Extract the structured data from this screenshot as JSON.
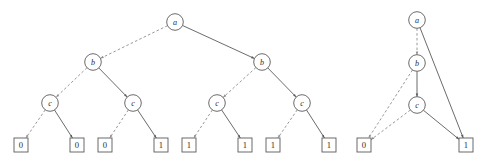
{
  "figure": {
    "width": 489,
    "height": 161,
    "colors": {
      "background": "#ffffff",
      "solid_edge": "#5a5a5a",
      "dashed_edge": "#8d8d8d",
      "node_stroke": "#5a5a5a",
      "node_fill": "#ffffff",
      "label_text": "#2b2b2b"
    },
    "edge_legend": {
      "dashed": "low edge (variable = 0)",
      "solid": "high edge (variable = 1)"
    }
  },
  "diagrams": [
    {
      "id": "decision-tree",
      "name": "full-binary-decision-tree",
      "variables": [
        "a",
        "b",
        "c"
      ],
      "nodes": [
        {
          "id": "t-a",
          "label": "a",
          "shape": "circle",
          "cx": 175,
          "cy": 22,
          "r": 8.3,
          "level": 0
        },
        {
          "id": "t-b1",
          "label": "b",
          "shape": "circle",
          "cx": 93,
          "cy": 62,
          "r": 8.3,
          "level": 1
        },
        {
          "id": "t-b2",
          "label": "b",
          "shape": "circle",
          "cx": 262,
          "cy": 62,
          "r": 8.3,
          "level": 1
        },
        {
          "id": "t-c1",
          "label": "c",
          "shape": "circle",
          "cx": 50,
          "cy": 103,
          "r": 8.3,
          "level": 2
        },
        {
          "id": "t-c2",
          "label": "c",
          "shape": "circle",
          "cx": 133,
          "cy": 103,
          "r": 8.3,
          "level": 2
        },
        {
          "id": "t-c3",
          "label": "c",
          "shape": "circle",
          "cx": 217,
          "cy": 103,
          "r": 8.3,
          "level": 2
        },
        {
          "id": "t-c4",
          "label": "c",
          "shape": "circle",
          "cx": 302,
          "cy": 103,
          "r": 8.3,
          "level": 2
        },
        {
          "id": "t-l1",
          "label": "0",
          "shape": "box",
          "cx": 21,
          "cy": 145,
          "w": 14,
          "h": 14,
          "level": 3
        },
        {
          "id": "t-l2",
          "label": "0",
          "shape": "box",
          "cx": 77,
          "cy": 145,
          "w": 14,
          "h": 14,
          "level": 3
        },
        {
          "id": "t-l3",
          "label": "0",
          "shape": "box",
          "cx": 105,
          "cy": 145,
          "w": 14,
          "h": 14,
          "level": 3
        },
        {
          "id": "t-l4",
          "label": "1",
          "shape": "box",
          "cx": 161,
          "cy": 145,
          "w": 14,
          "h": 14,
          "level": 3
        },
        {
          "id": "t-l5",
          "label": "1",
          "shape": "box",
          "cx": 189,
          "cy": 145,
          "w": 14,
          "h": 14,
          "level": 3
        },
        {
          "id": "t-l6",
          "label": "1",
          "shape": "box",
          "cx": 245,
          "cy": 145,
          "w": 14,
          "h": 14,
          "level": 3
        },
        {
          "id": "t-l7",
          "label": "1",
          "shape": "box",
          "cx": 273,
          "cy": 145,
          "w": 14,
          "h": 14,
          "level": 3
        },
        {
          "id": "t-l8",
          "label": "1",
          "shape": "box",
          "cx": 329,
          "cy": 145,
          "w": 14,
          "h": 14,
          "level": 3
        }
      ],
      "edges": [
        {
          "from": "t-a",
          "to": "t-b1",
          "style": "dashed",
          "value": "0"
        },
        {
          "from": "t-a",
          "to": "t-b2",
          "style": "solid",
          "value": "1"
        },
        {
          "from": "t-b1",
          "to": "t-c1",
          "style": "dashed",
          "value": "0"
        },
        {
          "from": "t-b1",
          "to": "t-c2",
          "style": "solid",
          "value": "1"
        },
        {
          "from": "t-b2",
          "to": "t-c3",
          "style": "dashed",
          "value": "0"
        },
        {
          "from": "t-b2",
          "to": "t-c4",
          "style": "solid",
          "value": "1"
        },
        {
          "from": "t-c1",
          "to": "t-l1",
          "style": "dashed",
          "value": "0"
        },
        {
          "from": "t-c1",
          "to": "t-l2",
          "style": "solid",
          "value": "1"
        },
        {
          "from": "t-c2",
          "to": "t-l3",
          "style": "dashed",
          "value": "0"
        },
        {
          "from": "t-c2",
          "to": "t-l4",
          "style": "solid",
          "value": "1"
        },
        {
          "from": "t-c3",
          "to": "t-l5",
          "style": "dashed",
          "value": "0"
        },
        {
          "from": "t-c3",
          "to": "t-l6",
          "style": "solid",
          "value": "1"
        },
        {
          "from": "t-c4",
          "to": "t-l7",
          "style": "dashed",
          "value": "0"
        },
        {
          "from": "t-c4",
          "to": "t-l8",
          "style": "solid",
          "value": "1"
        }
      ]
    },
    {
      "id": "reduced-bdd",
      "name": "reduced-binary-decision-diagram",
      "variables": [
        "a",
        "b",
        "c"
      ],
      "nodes": [
        {
          "id": "r-a",
          "label": "a",
          "shape": "circle",
          "cx": 417,
          "cy": 20,
          "r": 8.3,
          "level": 0
        },
        {
          "id": "r-b",
          "label": "b",
          "shape": "circle",
          "cx": 417,
          "cy": 63,
          "r": 8.3,
          "level": 1
        },
        {
          "id": "r-c",
          "label": "c",
          "shape": "circle",
          "cx": 417,
          "cy": 105,
          "r": 8.3,
          "level": 2
        },
        {
          "id": "r-l0",
          "label": "0",
          "shape": "box",
          "cx": 364,
          "cy": 145,
          "w": 14,
          "h": 14,
          "level": 3
        },
        {
          "id": "r-l1",
          "label": "1",
          "shape": "box",
          "cx": 466,
          "cy": 145,
          "w": 14,
          "h": 14,
          "level": 3
        }
      ],
      "edges": [
        {
          "from": "r-a",
          "to": "r-b",
          "style": "dashed",
          "value": "0"
        },
        {
          "from": "r-a",
          "to": "r-l1",
          "style": "solid",
          "value": "1"
        },
        {
          "from": "r-b",
          "to": "r-l0",
          "style": "dashed",
          "value": "0"
        },
        {
          "from": "r-b",
          "to": "r-c",
          "style": "solid",
          "value": "1"
        },
        {
          "from": "r-c",
          "to": "r-l0",
          "style": "dashed",
          "value": "0"
        },
        {
          "from": "r-c",
          "to": "r-l1",
          "style": "solid",
          "value": "1"
        }
      ]
    }
  ]
}
